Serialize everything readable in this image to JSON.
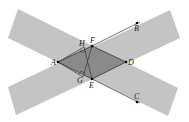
{
  "diagram": {
    "colors": {
      "band": "#c4c4c4",
      "overlap": "#8a8a8a",
      "line": "#333333",
      "point": "#000000"
    },
    "bands": [
      {
        "name": "band-descending",
        "points": "18,9 8,38 168,116 178,88"
      },
      {
        "name": "band-ascending",
        "points": "8,87 16,115 180,38 170,10"
      }
    ],
    "rhombus": {
      "points": "58,62 92,46 126,62 92,79"
    },
    "points": {
      "A": {
        "label": "A",
        "x": 58,
        "y": 62
      },
      "B": {
        "label": "B",
        "x": 137,
        "y": 23
      },
      "C": {
        "label": "C",
        "x": 137,
        "y": 102
      },
      "D": {
        "label": "D",
        "x": 126,
        "y": 62
      },
      "E": {
        "label": "E",
        "x": 92,
        "y": 79
      },
      "F": {
        "label": "F",
        "x": 92,
        "y": 46
      },
      "G": {
        "label": "G",
        "x": 83,
        "y": 77
      },
      "H": {
        "label": "H",
        "x": 84,
        "y": 47
      }
    }
  }
}
